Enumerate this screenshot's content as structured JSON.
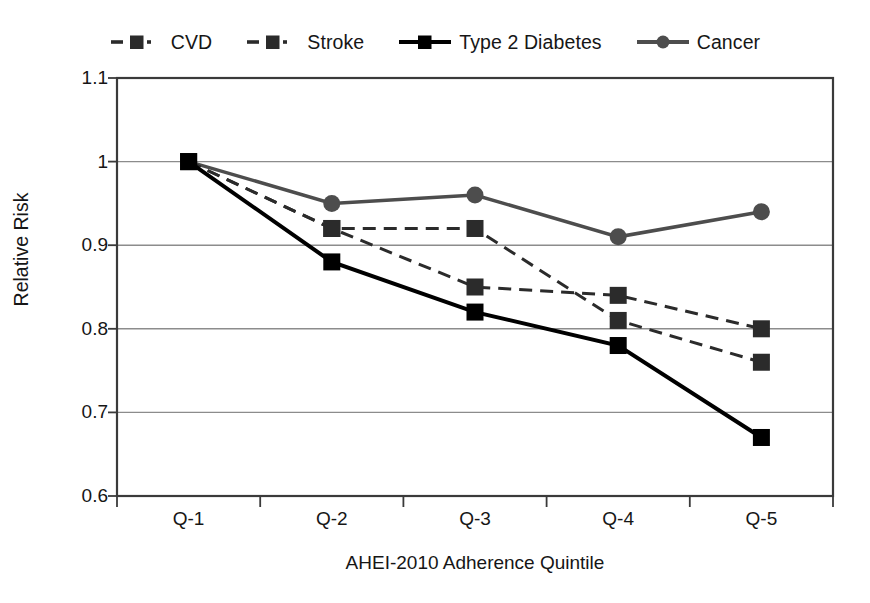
{
  "chart_data": {
    "type": "line",
    "title": "",
    "xlabel": "AHEI-2010 Adherence Quintile",
    "ylabel": "Relative Risk",
    "categories": [
      "Q-1",
      "Q-2",
      "Q-3",
      "Q-4",
      "Q-5"
    ],
    "ylim": [
      0.6,
      1.1
    ],
    "yticks": [
      "0.6",
      "0.7",
      "0.8",
      "0.9",
      "1",
      "1.1"
    ],
    "ytick_values": [
      0.6,
      0.7,
      0.8,
      0.9,
      1.0,
      1.1
    ],
    "grid": true,
    "legend_position": "top-center",
    "series": [
      {
        "name": "CVD",
        "values": [
          1.0,
          0.92,
          0.92,
          0.81,
          0.76
        ],
        "color": "#2b2b2b",
        "line_style": "dash-dot",
        "marker": "square",
        "line_width": 3
      },
      {
        "name": "Stroke",
        "values": [
          1.0,
          0.92,
          0.85,
          0.84,
          0.8
        ],
        "color": "#2b2b2b",
        "line_style": "dash-dot",
        "marker": "square",
        "line_width": 3
      },
      {
        "name": "Type 2 Diabetes",
        "values": [
          1.0,
          0.88,
          0.82,
          0.78,
          0.67
        ],
        "color": "#000000",
        "line_style": "solid",
        "marker": "square",
        "line_width": 4
      },
      {
        "name": "Cancer",
        "values": [
          1.0,
          0.95,
          0.96,
          0.91,
          0.94
        ],
        "color": "#4d4d4d",
        "line_style": "solid",
        "marker": "circle",
        "line_width": 3.5
      }
    ]
  },
  "legend": {
    "items": [
      {
        "label": "CVD",
        "marker": "square",
        "line_style": "dash-dot",
        "color": "#2b2b2b"
      },
      {
        "label": "Stroke",
        "marker": "square",
        "line_style": "dash-dot",
        "color": "#2b2b2b"
      },
      {
        "label": "Type 2 Diabetes",
        "marker": "square",
        "line_style": "solid",
        "color": "#000000"
      },
      {
        "label": "Cancer",
        "marker": "circle",
        "line_style": "solid",
        "color": "#4d4d4d"
      }
    ]
  },
  "axes": {
    "y_label": "Relative Risk",
    "x_label": "AHEI-2010 Adherence Quintile",
    "y_ticks": [
      "1.1",
      "1",
      "0.9",
      "0.8",
      "0.7",
      "0.6"
    ],
    "x_ticks": [
      "Q-1",
      "Q-2",
      "Q-3",
      "Q-4",
      "Q-5"
    ],
    "axis_color": "#3a3a3a",
    "grid_color": "#8c8c8c"
  }
}
